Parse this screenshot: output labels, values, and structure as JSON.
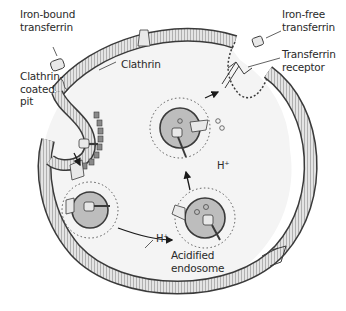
{
  "diagram": {
    "labels": {
      "iron_bound_transferrin": "Iron-bound\ntransferrin",
      "clathrin_coated_pit": "Clathrin-\ncoated\npit",
      "clathrin": "Clathrin",
      "iron_free_transferrin": "Iron-free\ntransferrin",
      "transferrin_receptor": "Transferrin\nreceptor",
      "h_plus_top": "H⁺",
      "h_plus_left": "H⁺",
      "acidified_endosome": "Acidified\nendosome"
    },
    "colors": {
      "membrane_fill": "#d9d9d9",
      "membrane_edge": "#3a3a3a",
      "lipid_head": "#4a4a4a",
      "cell_interior": "#f4f4f4",
      "endosome_core": "#bdbdbd",
      "protein": "#e8e8e8",
      "text": "#2a2a2a"
    }
  }
}
